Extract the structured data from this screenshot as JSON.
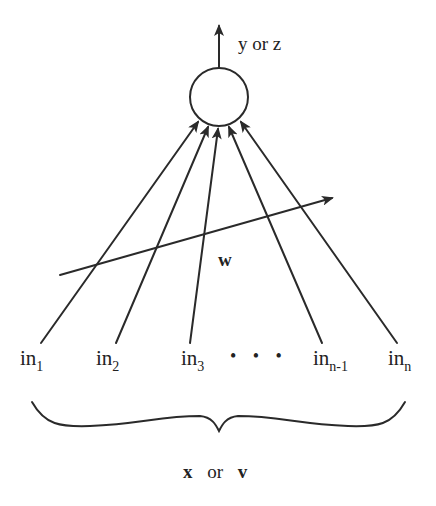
{
  "diagram": {
    "colors": {
      "ink": "#2a2a2a",
      "background": "#ffffff"
    },
    "neuron": {
      "shape": "circle"
    },
    "output": {
      "label": "y or z"
    },
    "weights": {
      "label": "w"
    },
    "inputs": [
      {
        "base": "in",
        "subscript": "1"
      },
      {
        "base": "in",
        "subscript": "2"
      },
      {
        "base": "in",
        "subscript": "3"
      },
      {
        "base": "in",
        "subscript": "n-1"
      },
      {
        "base": "in",
        "subscript": "n"
      }
    ],
    "ellipsis": "• • •",
    "input_vector": {
      "left": "x",
      "middle": "or",
      "right": "v"
    }
  }
}
